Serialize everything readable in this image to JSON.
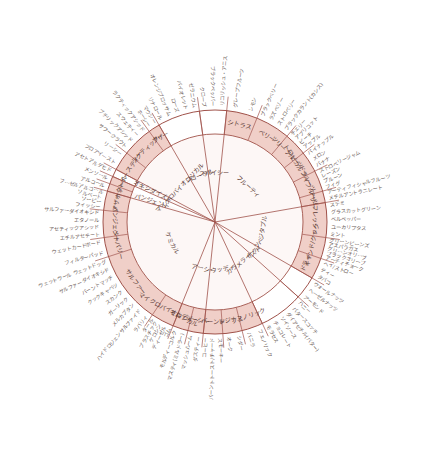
{
  "colors": {
    "shade": "#f0cfc8",
    "shade_light": "#f6e2dd",
    "line": "#a0524a",
    "text": "#5a3a34",
    "background": "#ffffff"
  },
  "center": {
    "x": 215,
    "y": 222
  },
  "radii": {
    "inner": 88,
    "middle": 112,
    "outer": 118
  },
  "categories": [
    {
      "name": "フルーティ",
      "start": -84,
      "end": -10,
      "shaded": false,
      "sub": [
        {
          "name": "シトラス",
          "start": -84,
          "end": -68,
          "shaded": true,
          "terms": [
            "グレープフルーツ",
            "レモン"
          ]
        },
        {
          "name": "ベリー",
          "start": -68,
          "end": -50,
          "shaded": true,
          "terms": [
            "ブラックベリー",
            "ラズベリー",
            "ストロベリー",
            "ブラックカラント(カシス)"
          ]
        },
        {
          "name": "(ツリー)フルーツ",
          "start": -50,
          "end": -38,
          "shaded": true,
          "terms": [
            "チェリー",
            "アプリコット",
            "ピーチ",
            "アップル"
          ]
        },
        {
          "name": "(トロピカル)フルーツ",
          "start": -38,
          "end": -27,
          "shaded": true,
          "terms": [
            "パイナップル",
            "メロン",
            "バナナ"
          ]
        },
        {
          "name": "(ドライ)フルーツ",
          "start": -27,
          "end": -16,
          "shaded": true,
          "terms": [
            "ストロベリージャム",
            "レーズン",
            "プルーン",
            "フィグ"
          ]
        },
        {
          "name": "アザー",
          "start": -16,
          "end": -10,
          "shaded": true,
          "terms": [
            "アーティフィシャルフルーツ",
            "メチルアントラニレート"
          ]
        }
      ]
    },
    {
      "name": "ベジタブル",
      "start": -10,
      "end": 30,
      "shaded": false,
      "sub": [
        {
          "name": "フレッシュ",
          "start": -10,
          "end": 8,
          "shaded": true,
          "terms": [
            "ステミ",
            "グラスカットグリーン",
            "ベルペッパー",
            "ユーカリプタス",
            "ミント"
          ]
        },
        {
          "name": "キャンド/クック",
          "start": 8,
          "end": 19,
          "shaded": true,
          "terms": [
            "グリーンビーンズ",
            "アスパラガス",
            "グリーンオリーブ",
            "ブラックオリーブ",
            "アーティチョーク"
          ]
        },
        {
          "name": "ドライ",
          "start": 19,
          "end": 30,
          "shaded": true,
          "terms": [
            "ヘイ/ストロー",
            "ティー",
            "タバコ"
          ]
        }
      ]
    },
    {
      "name": "ナッツ",
      "start": 30,
      "end": 42,
      "shaded": false,
      "sub": [
        {
          "name": "",
          "start": 30,
          "end": 42,
          "shaded": false,
          "terms": [
            "ウォールナッツ",
            "ヘーゼルナッツ",
            "アーモンド"
          ]
        }
      ]
    },
    {
      "name": "カラメライズド",
      "start": 42,
      "end": 65,
      "shaded": false,
      "sub": [
        {
          "name": "",
          "start": 42,
          "end": 65,
          "shaded": false,
          "terms": [
            "ハニー",
            "バタースコッチ",
            "ダイアセチル(バター)",
            "ソイソース",
            "チョコレート",
            "モラセス"
          ]
        }
      ]
    },
    {
      "name": "ウッディ",
      "start": 65,
      "end": 96,
      "shaded": false,
      "sub": [
        {
          "name": "フェノリック",
          "start": 65,
          "end": 76,
          "shaded": true,
          "terms": [
            "フェノリック",
            "バニラ"
          ]
        },
        {
          "name": "レジナス",
          "start": 76,
          "end": 86,
          "shaded": true,
          "terms": [
            "シダー",
            "オーク"
          ]
        },
        {
          "name": "バーンド",
          "start": 86,
          "end": 96,
          "shaded": true,
          "terms": [
            "スモーキー",
            "バーントトースト/チャード",
            "コーヒー"
          ]
        }
      ]
    },
    {
      "name": "アーシー",
      "start": 96,
      "end": 112,
      "shaded": false,
      "sub": [
        {
          "name": "アーシー",
          "start": 96,
          "end": 104,
          "shaded": true,
          "terms": [
            "ダスティー",
            "マッシュルーム"
          ]
        },
        {
          "name": "モルディー",
          "start": 104,
          "end": 112,
          "shaded": true,
          "terms": [
            "マスティ(ミルドラー)",
            "モルディーコルク"
          ]
        }
      ]
    },
    {
      "name": "ケミカル",
      "start": 112,
      "end": 196,
      "shaded": false,
      "sub": [
        {
          "name": "マイクロバイオロジカル",
          "start": 112,
          "end": 124,
          "shaded": true,
          "terms": [
            "ゴム",
            "ディーゼル",
            "ケロシン",
            "プラスチック",
            "タール"
          ]
        },
        {
          "name": "サルファー",
          "start": 124,
          "end": 162,
          "shaded": true,
          "terms": [
            "ラバリィ",
            "ハイドロジェンサルファイド",
            "メルカプタン",
            "ガーリック",
            "スカンク",
            "クックキャベツ",
            "バーントマッチ",
            "サルファーダイオキシド",
            "ウェットウール ウェットドッグ"
          ]
        },
        {
          "name": "ペーパリー",
          "start": 162,
          "end": 172,
          "shaded": true,
          "terms": [
            "フィルターパッド",
            "ウェットカードボード"
          ]
        },
        {
          "name": "パンジェント",
          "start": 172,
          "end": 186,
          "shaded": true,
          "terms": [
            "エチルアセテート",
            "アセティックアシッド",
            "エタノール",
            "サルファーダイオキシド"
          ]
        },
        {
          "name": "アザー",
          "start": 186,
          "end": 196,
          "shaded": true,
          "terms": [
            "フィッシー",
            "ソーピー",
            "ソルベート",
            "フーゼルアルコール"
          ]
        }
      ]
    },
    {
      "name": "パンジェント",
      "start": 196,
      "end": 200,
      "shaded": false,
      "sub": [
        {
          "name": "ホット",
          "start": 196,
          "end": 200,
          "shaded": true,
          "terms": [
            "アルコール"
          ]
        },
        {
          "name": "クール",
          "start": 200,
          "end": 204,
          "shaded": true,
          "terms": [
            "メンソール"
          ]
        }
      ]
    },
    {
      "name": "オキシダイズド",
      "start": 204,
      "end": 208,
      "shaded": false,
      "sub": [
        {
          "name": "",
          "start": 204,
          "end": 208,
          "shaded": false,
          "terms": [
            "アセトアルデヒド"
          ]
        }
      ]
    },
    {
      "name": "マイクロバイオロジカル",
      "start": 208,
      "end": 240,
      "shaded": false,
      "sub": [
        {
          "name": "イースティー",
          "start": 208,
          "end": 218,
          "shaded": true,
          "terms": [
            "フロアイースト",
            "リーシー"
          ]
        },
        {
          "name": "ラクティック",
          "start": 218,
          "end": 234,
          "shaded": true,
          "terms": [
            "サワークラウト",
            "ブチリックアシッド",
            "スウェティー",
            "ラクティックアシッド"
          ]
        },
        {
          "name": "アザー",
          "start": 234,
          "end": 240,
          "shaded": true,
          "terms": [
            "ホーシー",
            "マウシー"
          ]
        }
      ]
    },
    {
      "name": "フローラル",
      "start": 240,
      "end": 262,
      "shaded": false,
      "sub": [
        {
          "name": "",
          "start": 240,
          "end": 262,
          "shaded": false,
          "terms": [
            "リナロール",
            "オレンジブロッサム",
            "ローズ",
            "バイオレット",
            "ゼラニウム"
          ]
        }
      ]
    },
    {
      "name": "スパイシー",
      "start": 262,
      "end": 276,
      "shaded": false,
      "sub": [
        {
          "name": "",
          "start": 262,
          "end": 276,
          "shaded": false,
          "terms": [
            "クローブ",
            "ブラックペッパー",
            "リコリッシュ・アニス"
          ]
        }
      ]
    }
  ]
}
